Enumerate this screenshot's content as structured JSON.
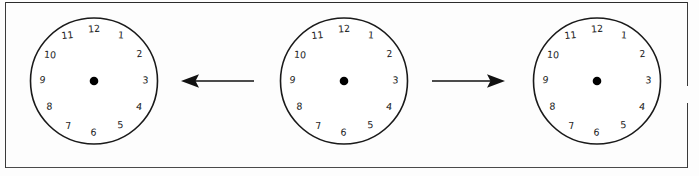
{
  "page": {
    "width": 699,
    "height": 176,
    "background_color": "#fdfdfd",
    "ink_color": "#1a1a1a",
    "rule_color": "#3a3a3a"
  },
  "diagram": {
    "type": "clock-transformation-sequence",
    "clock_numerals": [
      "12",
      "1",
      "2",
      "3",
      "4",
      "5",
      "6",
      "7",
      "8",
      "9",
      "10",
      "11"
    ],
    "numeral_style": "handwritten",
    "clocks": [
      {
        "id": "clock-left",
        "label": "left clock",
        "center_x": 94,
        "center_y": 81,
        "radius": 64,
        "hands": "none",
        "hub": "filled-dot"
      },
      {
        "id": "clock-middle",
        "label": "middle clock",
        "center_x": 344,
        "center_y": 81,
        "radius": 64,
        "hands": "none",
        "hub": "filled-dot"
      },
      {
        "id": "clock-right",
        "label": "right clock",
        "center_x": 597,
        "center_y": 81,
        "radius": 64,
        "hands": "none",
        "hub": "filled-dot"
      }
    ],
    "arrows": [
      {
        "id": "arrow-left",
        "direction": "left",
        "x": 180,
        "y": 68,
        "length": 74,
        "label": ""
      },
      {
        "id": "arrow-right",
        "direction": "right",
        "x": 430,
        "y": 68,
        "length": 74,
        "label": ""
      }
    ]
  }
}
